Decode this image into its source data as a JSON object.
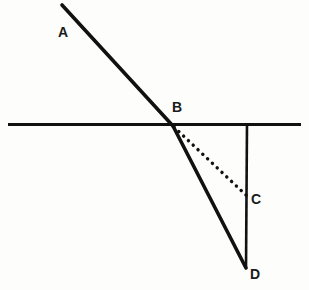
{
  "figure": {
    "background_color": "#fdfdfb",
    "stroke_color": "#111111",
    "canvas": {
      "width": 309,
      "height": 290
    },
    "labels": {
      "a": "A",
      "b": "B",
      "c": "C",
      "d": "D"
    },
    "points": {
      "A": {
        "x": 62,
        "y": 5
      },
      "B": {
        "x": 173,
        "y": 126
      },
      "C": {
        "x": 247,
        "y": 196
      },
      "D": {
        "x": 246,
        "y": 268
      }
    },
    "elements": {
      "horizontal_line": {
        "name": "horizontal-boundary-line",
        "x1": 8,
        "y1": 124.5,
        "x2": 301,
        "y2": 124.5,
        "stroke_width": 3.2,
        "style": "solid"
      },
      "incident_ray": {
        "name": "incident-ray-AB",
        "x1": 62,
        "y1": 5,
        "x2": 173,
        "y2": 126,
        "stroke_width": 3.6,
        "style": "solid"
      },
      "refracted_ray": {
        "name": "refracted-ray-BD",
        "x1": 173,
        "y1": 126,
        "x2": 246,
        "y2": 268,
        "stroke_width": 3.6,
        "style": "solid"
      },
      "vertical_line": {
        "name": "vertical-line-CD",
        "x1": 247,
        "y1": 124.5,
        "x2": 246,
        "y2": 268,
        "stroke_width": 2.6,
        "style": "solid"
      },
      "dotted_ray": {
        "name": "dotted-ray-BC",
        "x1": 174,
        "y1": 127,
        "x2": 247,
        "y2": 196,
        "stroke_width": 3.4,
        "style": "dotted",
        "dash_pattern": "0.1 6.5"
      }
    }
  }
}
